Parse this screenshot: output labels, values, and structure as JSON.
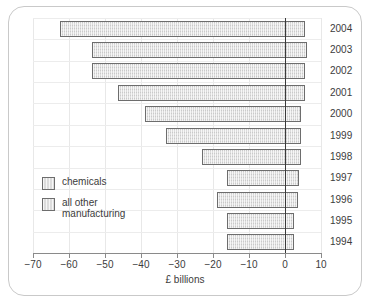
{
  "chart_data": {
    "type": "bar",
    "orientation": "horizontal",
    "title": "",
    "xlabel": "£ billions",
    "ylabel": "",
    "xlim": [
      -70,
      10
    ],
    "xticks": [
      -70,
      -60,
      -50,
      -40,
      -30,
      -20,
      -10,
      0,
      10
    ],
    "xtick_labels": [
      "−70",
      "−60",
      "−50",
      "−40",
      "−30",
      "−20",
      "−10",
      "0",
      "10"
    ],
    "categories": [
      "2004",
      "2003",
      "2002",
      "2001",
      "2000",
      "1999",
      "1998",
      "1997",
      "1996",
      "1995",
      "1994"
    ],
    "grid": true,
    "legend_position": "inside-left",
    "series": [
      {
        "name": "chemicals",
        "values": [
          5.5,
          6.0,
          5.5,
          5.5,
          4.5,
          4.5,
          4.5,
          4.0,
          3.5,
          2.5,
          2.5
        ]
      },
      {
        "name": "all other manufacturing",
        "values": [
          -62.5,
          -53.5,
          -53.5,
          -46.5,
          -39.0,
          -33.0,
          -23.0,
          -16.0,
          -19.0,
          -16.0,
          -16.0
        ]
      }
    ],
    "bars": [
      {
        "category": "2004",
        "negative": -62.5,
        "positive": 5.5
      },
      {
        "category": "2003",
        "negative": -53.5,
        "positive": 6.0
      },
      {
        "category": "2002",
        "negative": -53.5,
        "positive": 5.5
      },
      {
        "category": "2001",
        "negative": -46.5,
        "positive": 5.5
      },
      {
        "category": "2000",
        "negative": -39.0,
        "positive": 4.5
      },
      {
        "category": "1999",
        "negative": -33.0,
        "positive": 4.5
      },
      {
        "category": "1998",
        "negative": -23.0,
        "positive": 4.5
      },
      {
        "category": "1997",
        "negative": -16.0,
        "positive": 4.0
      },
      {
        "category": "1996",
        "negative": -19.0,
        "positive": 3.5
      },
      {
        "category": "1995",
        "negative": -16.0,
        "positive": 2.5
      },
      {
        "category": "1994",
        "negative": -16.0,
        "positive": 2.5
      }
    ],
    "legend": [
      {
        "label": "chemicals"
      },
      {
        "label": "all other\nmanufacturing"
      }
    ],
    "colors": {
      "bar_fill": "#dcdcdc",
      "bar_border": "#6d6d6d",
      "zero_line": "#3a3a3a",
      "grid": "#e8e8e8",
      "text": "#3c3c3c",
      "frame": "#c9c9c9"
    }
  }
}
